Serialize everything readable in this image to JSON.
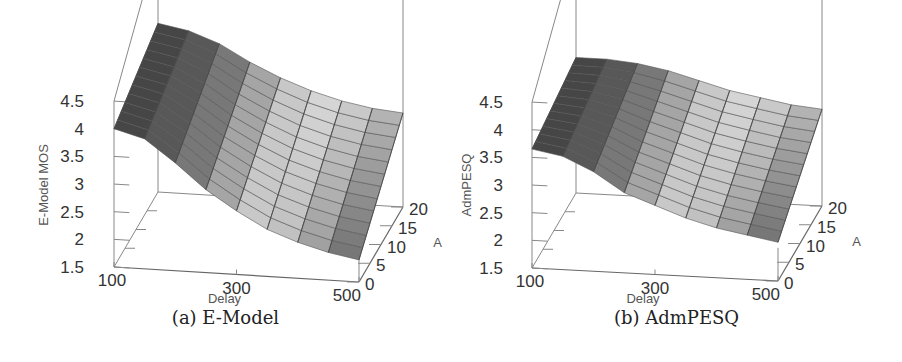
{
  "figure": {
    "panels": [
      {
        "id": "a",
        "caption": "(a) E-Model"
      },
      {
        "id": "b",
        "caption": "(b) AdmPESQ"
      }
    ]
  },
  "chart_data": [
    {
      "type": "surface3d",
      "title": "(a) E-Model",
      "xlabel": "Delay",
      "ylabel": "A",
      "zlabel": "E-Model MOS",
      "x_ticks": [
        "100",
        "300",
        "500"
      ],
      "y_ticks": [
        "0",
        "5",
        "10",
        "15",
        "20"
      ],
      "z_ticks": [
        "1.5",
        "2",
        "2.5",
        "3",
        "3.5",
        "4",
        "4.5"
      ],
      "xlim": [
        100,
        500
      ],
      "ylim": [
        0,
        20
      ],
      "zlim": [
        1.5,
        4.5
      ],
      "grid_x": [
        100,
        150,
        200,
        250,
        300,
        350,
        400,
        450,
        500
      ],
      "grid_y": [
        0,
        20
      ],
      "z_at_A0": [
        4.0,
        3.85,
        3.45,
        3.0,
        2.65,
        2.35,
        2.15,
        2.0,
        1.9
      ],
      "z_at_A20": [
        4.55,
        4.45,
        4.25,
        3.95,
        3.7,
        3.5,
        3.35,
        3.25,
        3.2
      ]
    },
    {
      "type": "surface3d",
      "title": "(b) AdmPESQ",
      "xlabel": "Delay",
      "ylabel": "A",
      "zlabel": "AdmPESQ",
      "x_ticks": [
        "100",
        "300",
        "500"
      ],
      "y_ticks": [
        "0",
        "5",
        "10",
        "15",
        "20"
      ],
      "z_ticks": [
        "1.5",
        "2",
        "2.5",
        "3",
        "3.5",
        "4",
        "4.5"
      ],
      "xlim": [
        100,
        500
      ],
      "ylim": [
        0,
        20
      ],
      "zlim": [
        1.5,
        4.5
      ],
      "grid_x": [
        100,
        150,
        200,
        250,
        300,
        350,
        400,
        450,
        500
      ],
      "grid_y": [
        0,
        20
      ],
      "z_at_A0": [
        3.65,
        3.55,
        3.3,
        2.95,
        2.75,
        2.55,
        2.4,
        2.3,
        2.2
      ],
      "z_at_A20": [
        3.95,
        3.95,
        3.9,
        3.8,
        3.65,
        3.5,
        3.4,
        3.3,
        3.25
      ]
    }
  ]
}
